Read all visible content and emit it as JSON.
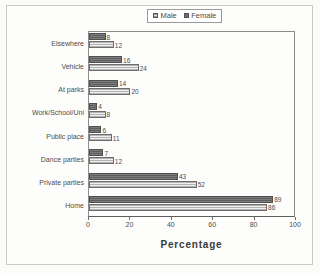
{
  "legend": {
    "items": [
      {
        "label": "Male",
        "swatch": "light-hatched-square",
        "color": "#e3e3e3"
      },
      {
        "label": "Female",
        "swatch": "dark-filled-square",
        "color": "#6e6e6e"
      }
    ]
  },
  "axis": {
    "title": "Percentage",
    "ticks": [
      "0",
      "20",
      "40",
      "60",
      "80",
      "100"
    ]
  },
  "chart_data": {
    "type": "bar",
    "orientation": "horizontal",
    "title": "",
    "xlabel": "Percentage",
    "ylabel": "",
    "xlim": [
      0,
      100
    ],
    "xticks": [
      0,
      20,
      40,
      60,
      80,
      100
    ],
    "grid": false,
    "legend_position": "top-center",
    "categories": [
      "Elsewhere",
      "Vehicle",
      "At parks",
      "Work/School/Uni",
      "Public place",
      "Dance parties",
      "Private parties",
      "Home"
    ],
    "series": [
      {
        "name": "Female",
        "values": [
          8,
          16,
          14,
          4,
          6,
          7,
          43,
          89
        ]
      },
      {
        "name": "Male",
        "values": [
          12,
          24,
          20,
          8,
          11,
          12,
          52,
          86
        ]
      }
    ]
  }
}
